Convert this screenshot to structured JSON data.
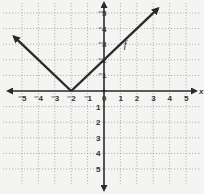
{
  "chart_data": {
    "type": "line",
    "title": "",
    "function_label": "f",
    "xlabel": "x",
    "ylabel": "",
    "xlim": [
      -6,
      6
    ],
    "ylim": [
      -6,
      6
    ],
    "grid": true,
    "x_ticks": [
      -5,
      -4,
      -3,
      -2,
      -1,
      0,
      1,
      2,
      3,
      4,
      5
    ],
    "y_ticks": [
      -5,
      -4,
      -3,
      -2,
      -1,
      1,
      2,
      3,
      4,
      5
    ],
    "series": [
      {
        "name": "f",
        "description": "absolute value function f(x) = |x + 2|, vertex at (-2, 0)",
        "points": [
          [
            -5.5,
            3.5
          ],
          [
            -2,
            0
          ],
          [
            3.3,
            5.3
          ]
        ],
        "vertex": [
          -2,
          0
        ],
        "y_intercept": [
          0,
          2
        ]
      }
    ],
    "tick_labels": {
      "x": [
        "-5",
        "-4",
        "-3",
        "-2",
        "-1",
        "0",
        "1",
        "2",
        "3",
        "4",
        "5"
      ],
      "y": [
        "5",
        "4",
        "3",
        "2",
        "1",
        "-1",
        "-2",
        "-3",
        "-4",
        "-5"
      ]
    }
  },
  "labels": {
    "x_axis": "x",
    "origin": "0",
    "function": "f"
  }
}
